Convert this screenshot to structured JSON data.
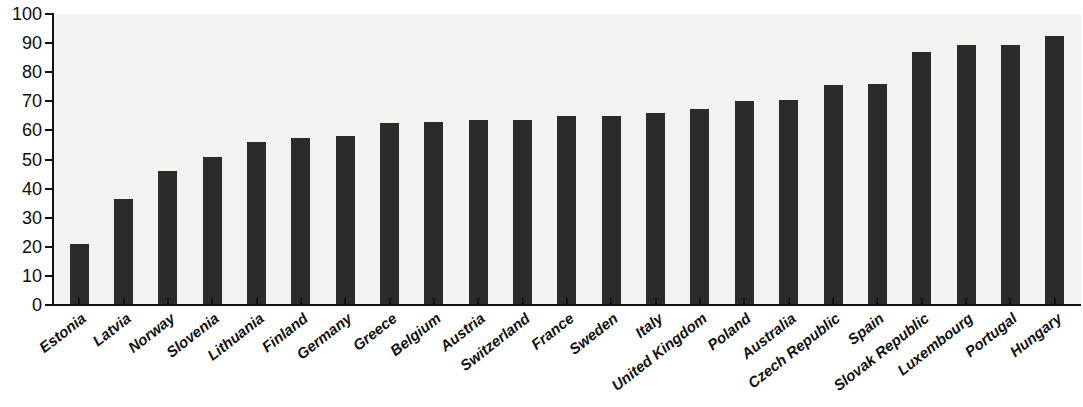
{
  "chart_data": {
    "type": "bar",
    "title": "",
    "xlabel": "",
    "ylabel": "",
    "ylim": [
      0,
      100
    ],
    "grid": false,
    "legend": null,
    "y_ticks": [
      0,
      10,
      20,
      30,
      40,
      50,
      60,
      70,
      80,
      90,
      100
    ],
    "categories": [
      "Estonia",
      "Latvia",
      "Norway",
      "Slovenia",
      "Lithuania",
      "Finland",
      "Germany",
      "Greece",
      "Belgium",
      "Austria",
      "Switzerland",
      "France",
      "Sweden",
      "Italy",
      "United Kingdom",
      "Poland",
      "Australia",
      "Czech Republic",
      "Spain",
      "Slovak Republic",
      "Luxembourg",
      "Portugal",
      "Hungary"
    ],
    "values": [
      21,
      36.5,
      46,
      51,
      56,
      57.5,
      58,
      62.5,
      63,
      63.5,
      63.5,
      65,
      65,
      66,
      67.5,
      70,
      70.5,
      75.5,
      76,
      87,
      89.5,
      89.5,
      92.5
    ],
    "bar_color": "#2b2b2b",
    "plot_background": "#f2f2f0",
    "axis_color": "#111111"
  }
}
